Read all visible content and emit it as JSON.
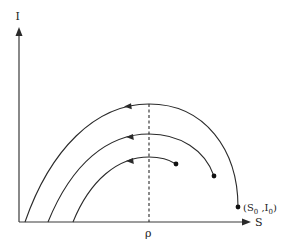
{
  "diagram": {
    "type": "phase-plane",
    "x_axis_label": "S",
    "y_axis_label": "I",
    "threshold_label": "ρ",
    "start_point_label": {
      "open": "(S",
      "sub1": "0",
      "mid": " ,I",
      "sub2": "0",
      "close": ")"
    },
    "colors": {
      "line": "#2a2a2a",
      "background": "#ffffff"
    },
    "trajectories": [
      {
        "name": "outer",
        "has_start_dot": true,
        "has_direction_arrow": true
      },
      {
        "name": "middle",
        "has_start_dot": true,
        "has_direction_arrow": true
      },
      {
        "name": "inner",
        "has_start_dot": true,
        "has_direction_arrow": true
      }
    ]
  }
}
